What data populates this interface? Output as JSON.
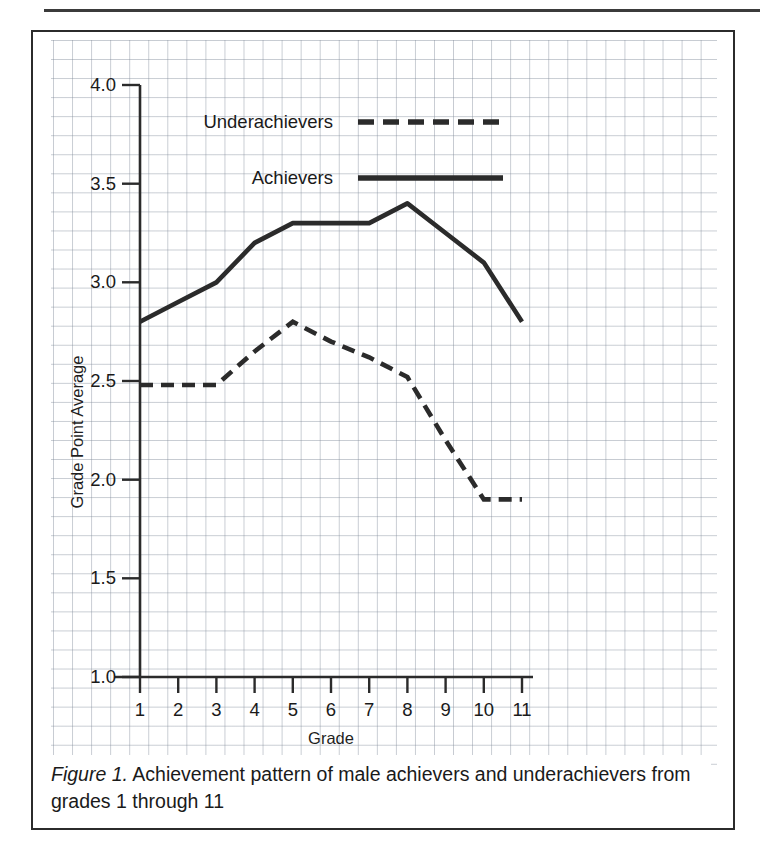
{
  "figure": {
    "caption_label": "Figure 1.",
    "caption_text": " Achievement pattern of male achievers and underachievers from grades 1 through 11"
  },
  "chart_data": {
    "type": "line",
    "title": "",
    "xlabel": "Grade",
    "ylabel": "Grade Point Average",
    "x": [
      1,
      2,
      3,
      4,
      5,
      6,
      7,
      8,
      9,
      10,
      11
    ],
    "xtick_labels": [
      "1",
      "2",
      "3",
      "4",
      "5",
      "6",
      "7",
      "8",
      "9",
      "10",
      "11"
    ],
    "ytick_labels": [
      "1.0",
      "1.5",
      "2.0",
      "2.5",
      "3.0",
      "3.5",
      "4.0"
    ],
    "ytick_values": [
      1.0,
      1.5,
      2.0,
      2.5,
      3.0,
      3.5,
      4.0
    ],
    "xlim": [
      1,
      11
    ],
    "ylim": [
      1.0,
      4.0
    ],
    "grid": "graph-paper background, no plot gridlines",
    "legend_position": "upper-center inside plot",
    "series": [
      {
        "name": "Achievers",
        "style": "solid",
        "color": "#2b2b2b",
        "values": [
          2.8,
          2.9,
          3.0,
          3.2,
          3.3,
          3.3,
          3.3,
          3.4,
          3.25,
          3.1,
          2.8
        ]
      },
      {
        "name": "Underachievers",
        "style": "dashed",
        "color": "#2b2b2b",
        "values": [
          2.48,
          2.48,
          2.48,
          2.65,
          2.8,
          2.7,
          2.62,
          2.52,
          2.2,
          1.9,
          1.9
        ]
      }
    ]
  },
  "legend": {
    "entries": [
      {
        "label": "Underachievers",
        "style": "dashed"
      },
      {
        "label": "Achievers",
        "style": "solid"
      }
    ]
  },
  "colors": {
    "line": "#2b2b2b",
    "axis": "#2b2b2b",
    "grid": "#8a94a3",
    "text": "#1a1a1a",
    "border": "#2b2b2b"
  }
}
